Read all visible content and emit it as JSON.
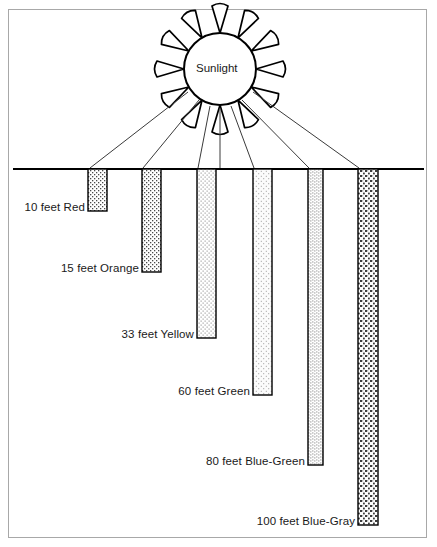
{
  "diagram": {
    "title_visible": false,
    "sun": {
      "label": "Sunlight",
      "center_x": 220,
      "center_y": 69,
      "radius": 36,
      "ray_count": 12
    },
    "surface_line": {
      "name": "water-surface-line",
      "x1": 13,
      "x2": 424,
      "y": 169
    },
    "ray_endpoints_x": [
      90,
      143,
      198,
      254,
      309,
      359,
      220
    ],
    "bars": [
      {
        "id": "red",
        "depth_label": "10 feet Red",
        "depth_feet": 10,
        "color_name": "Red",
        "x": 88,
        "width": 19,
        "bottom_y": 211,
        "texture": "dense-stipple",
        "fill": "#d8d8d8"
      },
      {
        "id": "orange",
        "depth_label": "15 feet Orange",
        "depth_feet": 15,
        "color_name": "Orange",
        "x": 142,
        "width": 19,
        "bottom_y": 272,
        "texture": "dense-stipple",
        "fill": "#d8d8d8"
      },
      {
        "id": "yellow",
        "depth_label": "33 feet Yellow",
        "depth_feet": 33,
        "color_name": "Yellow",
        "x": 197,
        "width": 19,
        "bottom_y": 338,
        "texture": "fine-stipple",
        "fill": "#e6e6e6"
      },
      {
        "id": "green",
        "depth_label": "60 feet Green",
        "depth_feet": 60,
        "color_name": "Green",
        "x": 253,
        "width": 19,
        "bottom_y": 395,
        "texture": "light-stipple",
        "fill": "#ececec"
      },
      {
        "id": "blue-green",
        "depth_label": "80 feet Blue-Green",
        "depth_feet": 80,
        "color_name": "Blue-Green",
        "x": 308,
        "width": 15,
        "bottom_y": 465,
        "texture": "vertical-dotted",
        "fill": "#f0f0f0"
      },
      {
        "id": "blue-gray",
        "depth_label": "100 feet Blue-Gray",
        "depth_feet": 100,
        "color_name": "Blue-Gray",
        "x": 358,
        "width": 20,
        "bottom_y": 525,
        "texture": "coarse-stipple",
        "fill": "#cfcfcf"
      }
    ],
    "labels": [
      {
        "text": "10 feet Red",
        "right": 85,
        "baseline_y": 211
      },
      {
        "text": "15 feet Orange",
        "right": 139,
        "baseline_y": 272
      },
      {
        "text": "33 feet Yellow",
        "right": 194,
        "baseline_y": 338
      },
      {
        "text": "60 feet Green",
        "right": 250,
        "baseline_y": 395
      },
      {
        "text": "80 feet Blue-Green",
        "right": 305,
        "baseline_y": 465
      },
      {
        "text": "100 feet Blue-Gray",
        "right": 355,
        "baseline_y": 525
      }
    ],
    "colors": {
      "ink": "#000000",
      "frame": "#a8a8a8",
      "text": "#1a1a1a",
      "background": "#ffffff"
    }
  }
}
